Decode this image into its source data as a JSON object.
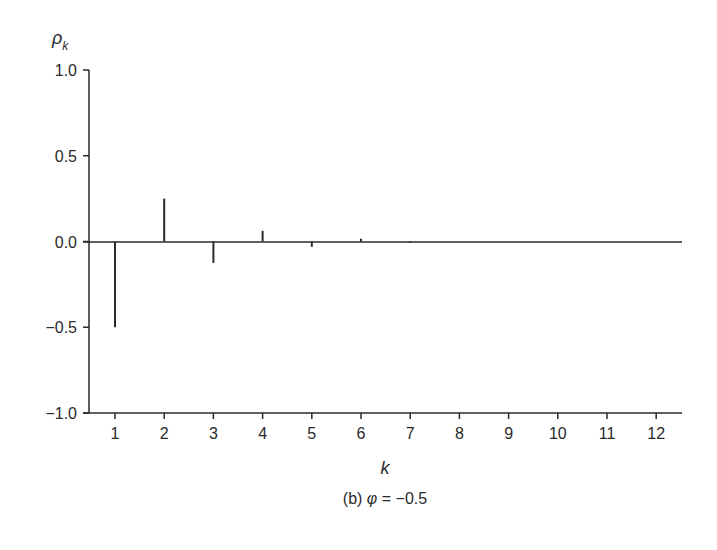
{
  "chart_data": {
    "type": "bar",
    "subtype": "stem",
    "title": "",
    "caption": "(b) φ = −0.5",
    "caption_prefix": "(b) ",
    "caption_symbol": "φ",
    "caption_rest": " = −0.5",
    "xlabel": "k",
    "ylabel": "ρ",
    "ylabel_subscript": "k",
    "ylim": [
      -1.0,
      1.0
    ],
    "xlim": [
      0.5,
      12.5
    ],
    "yticks": [
      1.0,
      0.5,
      0.0,
      -0.5,
      -1.0
    ],
    "ytick_labels": [
      "1.0",
      "0.5",
      "0.0",
      "−0.5",
      "−1.0"
    ],
    "categories": [
      1,
      2,
      3,
      4,
      5,
      6,
      7,
      8,
      9,
      10,
      11,
      12
    ],
    "xtick_labels": [
      "1",
      "2",
      "3",
      "4",
      "5",
      "6",
      "7",
      "8",
      "9",
      "10",
      "11",
      "12"
    ],
    "values": [
      -0.5,
      0.25,
      -0.125,
      0.0625,
      -0.03125,
      0.015625,
      -0.0078,
      0.0039,
      -0.002,
      0.001,
      -0.0005,
      0.0002
    ],
    "grid": false,
    "legend": null,
    "colors": {
      "stroke": "#2a2a2a",
      "background": "#ffffff"
    }
  }
}
